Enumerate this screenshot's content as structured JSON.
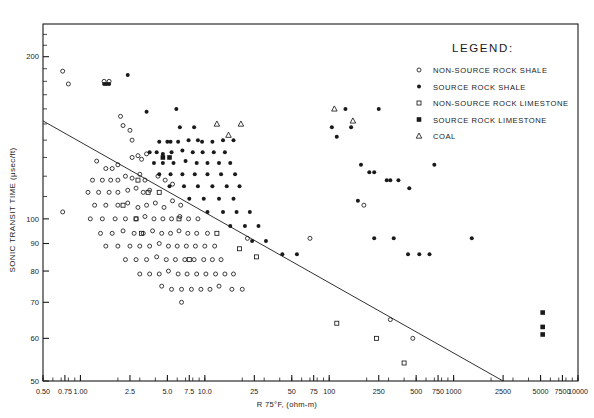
{
  "figure": {
    "background": "#ffffff",
    "ink": "#1a1a1a",
    "frame": {
      "left": 43,
      "top": 24,
      "right": 578,
      "bottom": 381
    }
  },
  "axes": {
    "x": {
      "label": "R 75°F, (ohm-m)",
      "scale": "log",
      "min": 0.5,
      "max": 10000,
      "major_ticks": [
        0.5,
        0.75,
        1.0,
        2.5,
        5.0,
        7.5,
        10.0,
        25,
        50,
        75,
        100,
        250,
        500,
        750,
        1000,
        2500,
        5000,
        7500,
        10000
      ],
      "tick_labels": [
        "0.50",
        "0.75",
        "1.00",
        "2.5",
        "5.0",
        "7.5",
        "10.0",
        "25",
        "50",
        "75",
        "100",
        "250",
        "500",
        "750",
        "1000",
        "2500",
        "5000",
        "7500",
        "10000"
      ]
    },
    "y": {
      "label": "SONIC TRANSIT TIME (μsec/ft)",
      "scale": "log",
      "min": 50,
      "max": 230,
      "major_ticks": [
        50,
        60,
        70,
        80,
        90,
        100,
        200
      ],
      "tick_labels": [
        "50",
        "60",
        "70",
        "80",
        "90",
        "100",
        "200"
      ],
      "minor_ticks": [
        110,
        120,
        130,
        140,
        150,
        160,
        170,
        180,
        190,
        210,
        220
      ]
    }
  },
  "legend": {
    "title": "LEGEND:",
    "x": 440,
    "y": 52,
    "items": [
      {
        "marker": "open-circle",
        "label": "NON-SOURCE ROCK SHALE"
      },
      {
        "marker": "filled-circle",
        "label": "SOURCE ROCK SHALE"
      },
      {
        "marker": "open-square",
        "label": "NON-SOURCE ROCK LIMESTONE"
      },
      {
        "marker": "filled-square",
        "label": "SOURCE ROCK LIMESTONE"
      },
      {
        "marker": "open-triangle",
        "label": "COAL"
      }
    ]
  },
  "chart_data": {
    "type": "scatter",
    "title": "",
    "xlabel": "R 75°F, (ohm-m)",
    "ylabel": "SONIC TRANSIT TIME (μsec/ft)",
    "xscale": "log",
    "yscale": "log",
    "xlim": [
      0.5,
      10000
    ],
    "ylim": [
      50,
      230
    ],
    "grid": false,
    "legend_position": "upper-right",
    "trendline": {
      "name": "overlay-baseline",
      "x": [
        0.5,
        2500
      ],
      "y": [
        152,
        50
      ],
      "style": "solid-thin"
    },
    "series": [
      {
        "name": "NON-SOURCE ROCK SHALE",
        "marker": "open-circle",
        "points": [
          [
            0.72,
            188
          ],
          [
            0.8,
            178
          ],
          [
            0.72,
            103
          ],
          [
            1.55,
            180
          ],
          [
            1.7,
            180
          ],
          [
            2.1,
            155
          ],
          [
            2.2,
            149
          ],
          [
            2.5,
            146
          ],
          [
            2.6,
            140
          ],
          [
            1.35,
            128
          ],
          [
            1.6,
            124
          ],
          [
            1.8,
            124
          ],
          [
            2.0,
            126
          ],
          [
            2.6,
            130
          ],
          [
            2.9,
            131
          ],
          [
            3.1,
            129
          ],
          [
            3.4,
            132
          ],
          [
            1.25,
            118
          ],
          [
            1.5,
            118
          ],
          [
            1.75,
            118
          ],
          [
            2.0,
            118
          ],
          [
            2.3,
            120
          ],
          [
            2.6,
            119
          ],
          [
            3.0,
            121
          ],
          [
            3.3,
            118
          ],
          [
            1.15,
            112
          ],
          [
            1.4,
            112
          ],
          [
            1.7,
            112
          ],
          [
            2.0,
            112
          ],
          [
            2.4,
            113
          ],
          [
            2.8,
            114
          ],
          [
            3.2,
            112
          ],
          [
            3.6,
            113
          ],
          [
            4.2,
            120
          ],
          [
            4.8,
            118
          ],
          [
            5.5,
            116
          ],
          [
            1.3,
            106
          ],
          [
            1.6,
            106
          ],
          [
            2.0,
            106
          ],
          [
            2.4,
            107
          ],
          [
            2.9,
            105
          ],
          [
            3.4,
            106
          ],
          [
            4.0,
            107
          ],
          [
            4.7,
            105
          ],
          [
            5.5,
            108
          ],
          [
            6.4,
            106
          ],
          [
            1.2,
            100
          ],
          [
            1.5,
            100
          ],
          [
            1.9,
            100
          ],
          [
            2.3,
            100
          ],
          [
            2.8,
            100
          ],
          [
            3.3,
            101
          ],
          [
            3.9,
            100
          ],
          [
            4.6,
            100
          ],
          [
            5.4,
            100
          ],
          [
            6.3,
            101
          ],
          [
            7.4,
            100
          ],
          [
            8.8,
            100
          ],
          [
            1.45,
            94
          ],
          [
            1.8,
            94
          ],
          [
            2.2,
            95
          ],
          [
            2.7,
            94
          ],
          [
            3.2,
            94
          ],
          [
            3.8,
            95
          ],
          [
            4.5,
            94
          ],
          [
            5.3,
            94
          ],
          [
            6.2,
            95
          ],
          [
            7.3,
            94
          ],
          [
            8.6,
            94
          ],
          [
            10.5,
            94
          ],
          [
            1.6,
            89
          ],
          [
            2.0,
            89
          ],
          [
            2.5,
            89
          ],
          [
            3.0,
            89
          ],
          [
            3.6,
            89
          ],
          [
            4.3,
            90
          ],
          [
            5.1,
            89
          ],
          [
            6.0,
            89
          ],
          [
            7.1,
            89
          ],
          [
            8.4,
            89
          ],
          [
            10.0,
            89
          ],
          [
            12.0,
            89
          ],
          [
            2.3,
            84
          ],
          [
            2.8,
            84
          ],
          [
            3.4,
            84
          ],
          [
            4.1,
            85
          ],
          [
            4.9,
            84
          ],
          [
            5.8,
            84
          ],
          [
            6.9,
            84
          ],
          [
            8.2,
            84
          ],
          [
            9.8,
            84
          ],
          [
            11.5,
            84
          ],
          [
            13.5,
            84
          ],
          [
            3.0,
            79
          ],
          [
            3.6,
            79
          ],
          [
            4.3,
            79
          ],
          [
            5.1,
            80
          ],
          [
            6.1,
            79
          ],
          [
            7.2,
            79
          ],
          [
            8.6,
            79
          ],
          [
            10.2,
            79
          ],
          [
            12.2,
            79
          ],
          [
            14.5,
            79
          ],
          [
            17.0,
            79
          ],
          [
            4.5,
            75
          ],
          [
            5.4,
            74
          ],
          [
            6.5,
            74
          ],
          [
            7.8,
            74
          ],
          [
            9.3,
            74
          ],
          [
            11.0,
            74
          ],
          [
            13.0,
            75
          ],
          [
            16.5,
            74
          ],
          [
            20.0,
            74
          ],
          [
            6.5,
            70
          ],
          [
            22.0,
            92
          ],
          [
            70.0,
            92
          ],
          [
            190.0,
            106
          ],
          [
            310.0,
            65
          ],
          [
            470.0,
            60
          ]
        ]
      },
      {
        "name": "SOURCE ROCK SHALE",
        "marker": "filled-circle",
        "points": [
          [
            2.4,
            185
          ],
          [
            1.55,
            178
          ],
          [
            1.62,
            178
          ],
          [
            1.7,
            178
          ],
          [
            3.4,
            158
          ],
          [
            5.9,
            160
          ],
          [
            6.3,
            148
          ],
          [
            8.2,
            148
          ],
          [
            4.3,
            139
          ],
          [
            5.0,
            139
          ],
          [
            5.3,
            139
          ],
          [
            6.1,
            139
          ],
          [
            7.4,
            140
          ],
          [
            8.8,
            140
          ],
          [
            9.5,
            139
          ],
          [
            11.5,
            139
          ],
          [
            14.0,
            140
          ],
          [
            17.0,
            140
          ],
          [
            3.6,
            133
          ],
          [
            4.1,
            133
          ],
          [
            4.6,
            132
          ],
          [
            5.4,
            133
          ],
          [
            6.6,
            134
          ],
          [
            8.0,
            133
          ],
          [
            9.6,
            133
          ],
          [
            11.8,
            133
          ],
          [
            14.5,
            133
          ],
          [
            3.9,
            127
          ],
          [
            4.6,
            127
          ],
          [
            5.6,
            127
          ],
          [
            7.0,
            128
          ],
          [
            8.6,
            127
          ],
          [
            10.5,
            127
          ],
          [
            13.0,
            127
          ],
          [
            16.0,
            127
          ],
          [
            4.3,
            121
          ],
          [
            5.3,
            121
          ],
          [
            6.6,
            121
          ],
          [
            8.3,
            121
          ],
          [
            10.5,
            121
          ],
          [
            13.5,
            121
          ],
          [
            17.5,
            121
          ],
          [
            5.2,
            115
          ],
          [
            6.8,
            115
          ],
          [
            8.8,
            115
          ],
          [
            11.5,
            115
          ],
          [
            15.0,
            115
          ],
          [
            19.0,
            115
          ],
          [
            7.5,
            109
          ],
          [
            9.8,
            109
          ],
          [
            13.0,
            109
          ],
          [
            17.0,
            109
          ],
          [
            10.5,
            103
          ],
          [
            14.0,
            103
          ],
          [
            18.0,
            103
          ],
          [
            23.0,
            103
          ],
          [
            16.0,
            97
          ],
          [
            21.0,
            97
          ],
          [
            27.0,
            97
          ],
          [
            24.0,
            91
          ],
          [
            31.0,
            91
          ],
          [
            42.0,
            86
          ],
          [
            55.0,
            86
          ],
          [
            105.0,
            148
          ],
          [
            150.0,
            148
          ],
          [
            115.0,
            142
          ],
          [
            135.0,
            160
          ],
          [
            250.0,
            160
          ],
          [
            180.0,
            126
          ],
          [
            210.0,
            122
          ],
          [
            230.0,
            122
          ],
          [
            290.0,
            118
          ],
          [
            310.0,
            118
          ],
          [
            360.0,
            118
          ],
          [
            440.0,
            114
          ],
          [
            700.0,
            126
          ],
          [
            170.0,
            108
          ],
          [
            230.0,
            92
          ],
          [
            330.0,
            92
          ],
          [
            430.0,
            86
          ],
          [
            530.0,
            86
          ],
          [
            640.0,
            86
          ],
          [
            1400.0,
            92
          ]
        ]
      },
      {
        "name": "NON-SOURCE ROCK LIMESTONE",
        "marker": "open-square",
        "points": [
          [
            2.9,
            118
          ],
          [
            3.5,
            112
          ],
          [
            4.3,
            112
          ],
          [
            2.2,
            106
          ],
          [
            2.8,
            100
          ],
          [
            3.1,
            94
          ],
          [
            6.2,
            100
          ],
          [
            12.5,
            94
          ],
          [
            7.5,
            84
          ],
          [
            19.0,
            88
          ],
          [
            26.0,
            85
          ],
          [
            240.0,
            60
          ],
          [
            400.0,
            54
          ],
          [
            115.0,
            64
          ]
        ]
      },
      {
        "name": "SOURCE ROCK LIMESTONE",
        "marker": "filled-square",
        "points": [
          [
            4.6,
            130
          ],
          [
            5.2,
            130
          ],
          [
            5200.0,
            67
          ],
          [
            5200.0,
            63
          ],
          [
            5200.0,
            61
          ]
        ]
      },
      {
        "name": "COAL",
        "marker": "open-triangle",
        "points": [
          [
            12.5,
            150
          ],
          [
            19.5,
            150
          ],
          [
            15.5,
            143
          ],
          [
            110.0,
            160
          ],
          [
            155.0,
            152
          ]
        ]
      }
    ]
  }
}
